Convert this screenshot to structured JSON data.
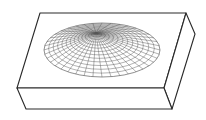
{
  "diagram": {
    "colors": {
      "background": "#ffffff",
      "edges": "#2a2a2a",
      "mesh": "#555555"
    },
    "box": {
      "top_face": [
        [
          40,
          13
        ],
        [
          186,
          13
        ],
        [
          164,
          88
        ],
        [
          17,
          88
        ]
      ],
      "right_face": [
        [
          186,
          13
        ],
        [
          195,
          34
        ],
        [
          172,
          109
        ],
        [
          164,
          88
        ]
      ],
      "front_face": [
        [
          17,
          88
        ],
        [
          164,
          88
        ],
        [
          172,
          109
        ],
        [
          26,
          109
        ]
      ]
    },
    "mesh": {
      "outer_center": [
        102,
        50
      ],
      "outer_rx": 58,
      "outer_ry": 27,
      "focus": [
        96,
        33
      ],
      "rings": 14,
      "spokes": 40
    }
  }
}
